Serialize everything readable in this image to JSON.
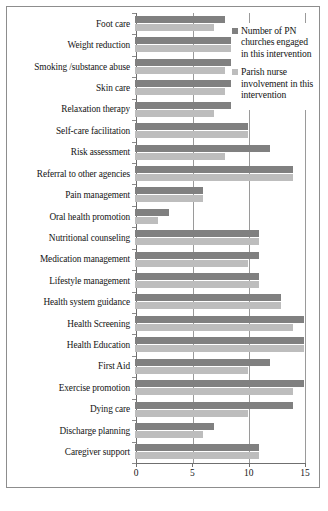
{
  "chart_data": {
    "type": "bar",
    "orientation": "horizontal",
    "title": "",
    "xlabel": "",
    "ylabel": "",
    "xlim": [
      0,
      15
    ],
    "xticks": [
      0,
      5,
      10,
      15
    ],
    "xtick_labels": [
      "0",
      "5",
      "10",
      "15"
    ],
    "grid": true,
    "legend_position": "top-right",
    "categories": [
      "Foot care",
      "Weight reduction",
      "Smoking /substance abuse",
      "Skin care",
      "Relaxation therapy",
      "Self-care facilitation",
      "Risk assessment",
      "Referral to other agencies",
      "Pain management",
      "Oral health promotion",
      "Nutritional counseling",
      "Medication management",
      "Lifestyle management",
      "Health system guidance",
      "Health Screening",
      "Health Education",
      "First Aid",
      "Exercise promotion",
      "Dying care",
      "Discharge planning",
      "Caregiver support"
    ],
    "series": [
      {
        "name": "Number of PN churches engaged in this intervention",
        "color": "#808080",
        "values": [
          8,
          9,
          9,
          9,
          9,
          10,
          12,
          14,
          6,
          3,
          11,
          11,
          11,
          13,
          15,
          15,
          12,
          15,
          14,
          7,
          11
        ]
      },
      {
        "name": "Parish nurse involvement in this intervention",
        "color": "#bdbdbd",
        "values": [
          7,
          9,
          8,
          8,
          7,
          10,
          8,
          14,
          6,
          2,
          11,
          10,
          11,
          13,
          14,
          15,
          10,
          14,
          10,
          6,
          11
        ]
      }
    ]
  },
  "legend": {
    "items": [
      {
        "label": "Number of PN churches engaged in this intervention",
        "color": "#808080"
      },
      {
        "label": "Parish nurse involvement in this intervention",
        "color": "#bdbdbd"
      }
    ]
  }
}
